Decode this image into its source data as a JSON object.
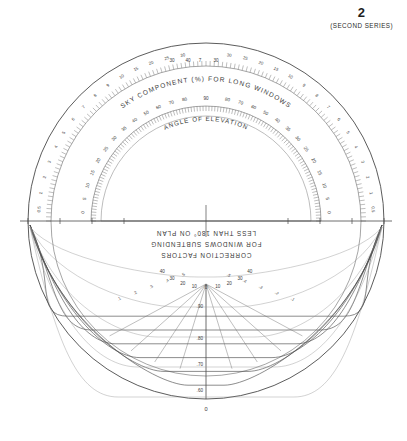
{
  "sheet": {
    "page_number": "2",
    "series_label": "(SECOND SERIES)",
    "background_color": "#ffffff",
    "ink_color": "#3a3a3a"
  },
  "outer_band": {
    "title": "SKY COMPONENT (%) FOR LONG WINDOWS",
    "tick_labels_left": [
      "0.5",
      "1",
      "2",
      "3",
      "4",
      "5",
      "6",
      "7",
      "8",
      "9",
      "10",
      "15",
      "20",
      "25",
      "30"
    ],
    "tick_labels_right": [
      "0.5",
      "1",
      "2",
      "3",
      "4",
      "5",
      "6",
      "7",
      "8",
      "9",
      "10",
      "15",
      "20",
      "25",
      "30"
    ],
    "apex_labels": [
      "30",
      "40",
      "7",
      "30"
    ]
  },
  "inner_band": {
    "title": "ANGLE OF ELEVATION",
    "tick_labels_left": [
      "0",
      "5",
      "10",
      "15",
      "20",
      "25",
      "30",
      "35",
      "40",
      "50",
      "60",
      "70",
      "80"
    ],
    "tick_labels_right": [
      "0",
      "5",
      "10",
      "15",
      "20",
      "25",
      "30",
      "35",
      "40",
      "50",
      "60",
      "70",
      "80"
    ],
    "apex_label": "90"
  },
  "lower_half": {
    "caption_lines": [
      "CORRECTION FACTORS",
      "FOR WINDOWS SUBTENDING",
      "LESS THAN 180° ON PLAN"
    ],
    "caption_orientation": "inverted",
    "azimuth_labels": [
      "40",
      "30",
      "20",
      "10",
      "0",
      "10",
      "20",
      "30",
      "40"
    ],
    "radial_factor_labels": [
      ".90",
      ".80",
      ".70",
      ".60"
    ],
    "bottom_label": "0",
    "curve_end_labels_left": [
      ".1",
      ".2",
      ".3",
      ".4",
      ".5"
    ],
    "curve_end_labels_right": [
      ".1",
      ".2",
      ".3",
      ".4",
      ".5"
    ],
    "correction_curve_values": [
      0.9,
      0.8,
      0.7,
      0.6,
      0.5,
      0.4
    ]
  },
  "chart_data": {
    "type": "line",
    "subtitle": "Sky component protractor for long windows with correction factors",
    "xlabel": "Azimuth on plan (degrees)",
    "ylabel": "Correction factor",
    "grid": false,
    "legend_position": "none",
    "upper_half": {
      "outer_scale_name": "Sky component (%) for long windows",
      "outer_scale_values": [
        0.5,
        1,
        2,
        3,
        4,
        5,
        6,
        7,
        8,
        9,
        10,
        15,
        20,
        25,
        30,
        40
      ],
      "inner_scale_name": "Angle of elevation (degrees)",
      "inner_scale_values": [
        0,
        5,
        10,
        15,
        20,
        25,
        30,
        35,
        40,
        50,
        60,
        70,
        80,
        90
      ]
    },
    "lower_half": {
      "x": [
        -40,
        -30,
        -20,
        -10,
        0,
        10,
        20,
        30,
        40
      ],
      "series": [
        {
          "name": "0.90",
          "values": [
            0.9,
            0.9,
            0.9,
            0.9,
            0.9,
            0.9,
            0.9,
            0.9,
            0.9
          ]
        },
        {
          "name": "0.80",
          "values": [
            0.8,
            0.8,
            0.8,
            0.8,
            0.8,
            0.8,
            0.8,
            0.8,
            0.8
          ]
        },
        {
          "name": "0.70",
          "values": [
            0.7,
            0.7,
            0.7,
            0.7,
            0.7,
            0.7,
            0.7,
            0.7,
            0.7
          ]
        },
        {
          "name": "0.60",
          "values": [
            0.6,
            0.6,
            0.6,
            0.6,
            0.6,
            0.6,
            0.6,
            0.6,
            0.6
          ]
        },
        {
          "name": "0.50",
          "values": [
            0.5,
            0.5,
            0.5,
            0.5,
            0.5,
            0.5,
            0.5,
            0.5,
            0.5
          ]
        },
        {
          "name": "0.40",
          "values": [
            0.4,
            0.4,
            0.4,
            0.4,
            0.4,
            0.4,
            0.4,
            0.4,
            0.4
          ]
        }
      ],
      "ylim": [
        0,
        1
      ]
    }
  }
}
